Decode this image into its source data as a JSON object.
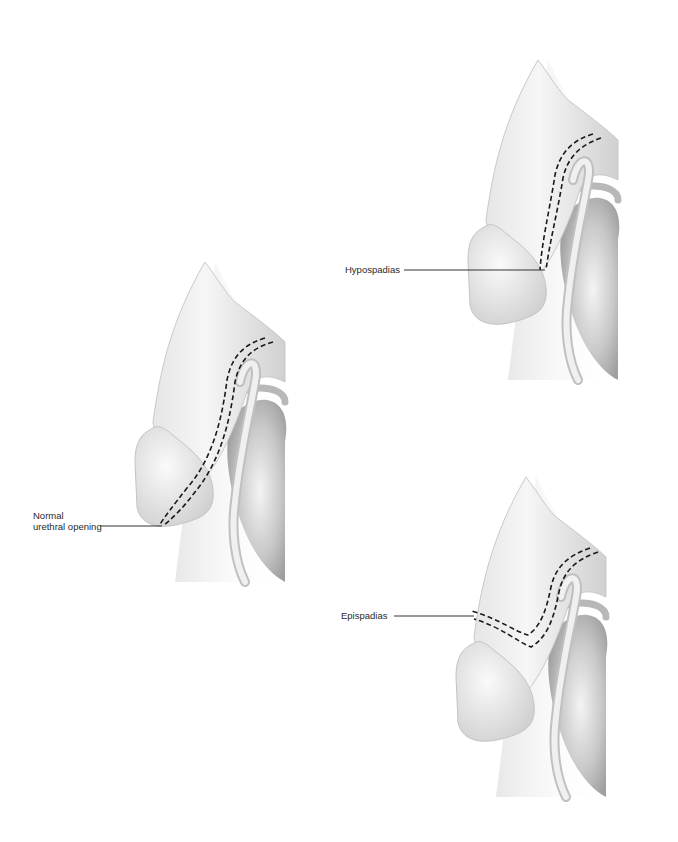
{
  "diagram": {
    "figures": [
      {
        "id": "normal",
        "label_line1": "Normal",
        "label_line2": "urethral opening"
      },
      {
        "id": "hypospadias",
        "label": "Hypospadias"
      },
      {
        "id": "epispadias",
        "label": "Epispadias"
      }
    ],
    "colors": {
      "skin_light": "#f2f2f2",
      "skin_shadow": "#bdbdbd",
      "outline": "#9a9a9a",
      "dash": "#1a1a1a",
      "leader": "#333333"
    }
  }
}
